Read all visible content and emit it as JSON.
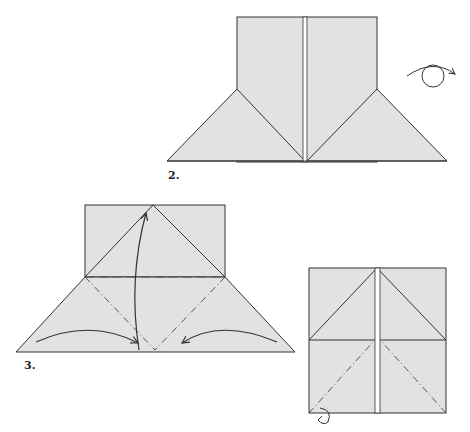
{
  "steps": [
    {
      "label": "2.",
      "description": "Folded base with turn-over symbol"
    },
    {
      "label": "3.",
      "description": "Valley and mountain fold lines with arrows"
    },
    {
      "label": "4.",
      "description": "Resulting square with diagonal mountain folds"
    }
  ],
  "step_labels": {
    "step2": "2.",
    "step3": "3."
  },
  "icons": {
    "turn_over": "turn-over-icon",
    "fold_arrow": "curved-arrow-icon",
    "hook_arrow": "push-fold-arrow-icon"
  },
  "colors": {
    "paper": "#e2e2e2",
    "line": "#333333",
    "background": "#ffffff"
  }
}
